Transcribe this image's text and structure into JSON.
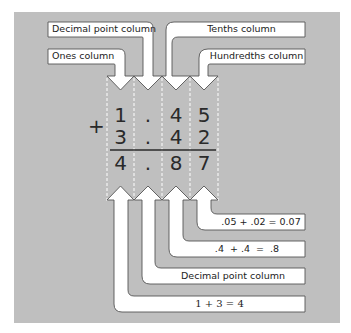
{
  "colors": {
    "panel": "#bfbfbf",
    "arrow_fill": "#ffffff",
    "arrow_stroke": "#555555",
    "divider": "#ffffff",
    "text": "#222222"
  },
  "top_labels": {
    "decimal_point": "Decimal point column",
    "ones": "Ones column",
    "tenths": "Tenths column",
    "hundredths": "Hundredths column"
  },
  "problem": {
    "operator": "+",
    "row1": [
      "1",
      ".",
      "4",
      "5"
    ],
    "row2": [
      "3",
      ".",
      "4",
      "2"
    ],
    "result": [
      "4",
      ".",
      "8",
      "7"
    ]
  },
  "bottom_labels": {
    "hundredths_sum": ".05 + .02 = 0.07",
    "tenths_sum": ".4  + .4  =  .8",
    "decimal_point": "Decimal point column",
    "ones_sum": "1 + 3 = 4"
  }
}
